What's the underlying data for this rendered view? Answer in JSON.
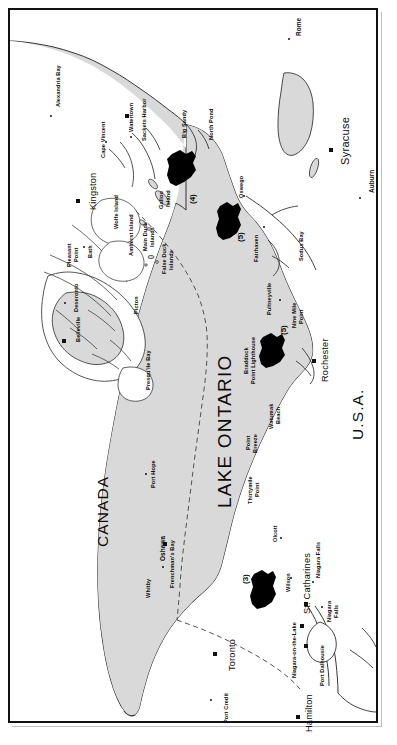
{
  "figure": {
    "title": "Lake Ontario",
    "lake_label": "LAKE ONTARIO",
    "countries": [
      {
        "name": "CANADA"
      },
      {
        "name": "U.S.A."
      }
    ],
    "colors": {
      "water_fill": "#d9d9d9",
      "land_fill": "#ffffff",
      "island_fill": "#d9d9d9",
      "coastline": "#2b2b2b",
      "zone_fill": "#000000",
      "border_dash": "#555555",
      "frame": "#111111",
      "text": "#0d0d0d",
      "hatch": "#9a9a9a"
    }
  },
  "lake": {
    "label": "LAKE ONTARIO"
  },
  "canada_label": "CANADA",
  "usa_label": "U.S.A.",
  "zones": [
    {
      "id": "3",
      "label": "(3)",
      "near": "Wilson / Niagara-on-the-Lake"
    },
    {
      "id": "4",
      "label": "(4)",
      "near": "Galloo Island / Big Sandy"
    },
    {
      "id": "5a",
      "label": "(5)",
      "near": "Oswego"
    },
    {
      "id": "5b",
      "label": "(5)",
      "near": "Braddock Point Lighthouse"
    }
  ],
  "places": {
    "canada_shore": [
      {
        "name": "Alexandria Bay",
        "marker": "dot"
      },
      {
        "name": "Kingston",
        "marker": "square"
      },
      {
        "name": "Pleasant Point",
        "marker": "none"
      },
      {
        "name": "Bath",
        "marker": "dot"
      },
      {
        "name": "Deseronto",
        "marker": "dot"
      },
      {
        "name": "Belleville",
        "marker": "square"
      },
      {
        "name": "Picton",
        "marker": "dot"
      },
      {
        "name": "Presqu'ile Bay",
        "marker": "none"
      },
      {
        "name": "Port Hope",
        "marker": "dot"
      },
      {
        "name": "Oshawa",
        "marker": "square"
      },
      {
        "name": "Whitby",
        "marker": "dot"
      },
      {
        "name": "Frenchman's Bay",
        "marker": "none"
      },
      {
        "name": "Toronto",
        "marker": "square"
      },
      {
        "name": "Port Credit",
        "marker": "dot"
      },
      {
        "name": "Hamilton",
        "marker": "square"
      },
      {
        "name": "St. Catharines",
        "marker": "square"
      },
      {
        "name": "Port Dalhousie",
        "marker": "square"
      },
      {
        "name": "Niagara-on-the-Lake",
        "marker": "square"
      },
      {
        "name": "Niagara Falls",
        "marker": "dot"
      }
    ],
    "usa_shore": [
      {
        "name": "Watertown",
        "marker": "square"
      },
      {
        "name": "Sackets Harbor",
        "marker": "dot"
      },
      {
        "name": "Cape Vincent",
        "marker": "dot"
      },
      {
        "name": "Big Sandy",
        "marker": "none"
      },
      {
        "name": "North Pond",
        "marker": "none"
      },
      {
        "name": "Oswego",
        "marker": "dot"
      },
      {
        "name": "Fairhaven",
        "marker": "dot"
      },
      {
        "name": "Sodus Bay",
        "marker": "none"
      },
      {
        "name": "Pultneyville",
        "marker": "dot"
      },
      {
        "name": "Nine Mile Point",
        "marker": "none"
      },
      {
        "name": "Braddock Point Lighthouse",
        "marker": "none"
      },
      {
        "name": "Rochester",
        "marker": "square"
      },
      {
        "name": "Watumak Beach",
        "marker": "none"
      },
      {
        "name": "Point Breeze",
        "marker": "none"
      },
      {
        "name": "Thirtymile Point",
        "marker": "none"
      },
      {
        "name": "Olcott",
        "marker": "dot"
      },
      {
        "name": "Wilson",
        "marker": "dot"
      },
      {
        "name": "Niagara Falls",
        "marker": "dot"
      },
      {
        "name": "Syracuse",
        "marker": "square"
      },
      {
        "name": "Rome",
        "marker": "dot"
      },
      {
        "name": "Auburn",
        "marker": "dot"
      }
    ],
    "islands": [
      {
        "name": "Wolfe Island"
      },
      {
        "name": "Amherst Island"
      },
      {
        "name": "Main Duck Islands"
      },
      {
        "name": "False Duck Islands"
      },
      {
        "name": "Galloo Island"
      }
    ]
  },
  "labels": [
    {
      "id": "alexandria-bay",
      "text": "Alexandria Bay",
      "x": 46,
      "y": 97,
      "cls": "small rot"
    },
    {
      "id": "kingston",
      "text": "Kingston",
      "x": 79,
      "y": 200,
      "cls": "city rot"
    },
    {
      "id": "pleasant-point-1",
      "text": "Pleasant",
      "x": 57,
      "y": 257,
      "cls": "small rot"
    },
    {
      "id": "pleasant-point-2",
      "text": "Point",
      "x": 64,
      "y": 252,
      "cls": "small rot"
    },
    {
      "id": "bath",
      "text": "Bath",
      "x": 78,
      "y": 248,
      "cls": "small rot"
    },
    {
      "id": "deseronto",
      "text": "Deseronto",
      "x": 64,
      "y": 302,
      "cls": "small rot"
    },
    {
      "id": "belleville",
      "text": "Belleville",
      "x": 66,
      "y": 332,
      "cls": "small rot"
    },
    {
      "id": "picton",
      "text": "Picton",
      "x": 124,
      "y": 304,
      "cls": "small rot"
    },
    {
      "id": "wolfe-island",
      "text": "Wolfe Island",
      "x": 104,
      "y": 219,
      "cls": "small rot"
    },
    {
      "id": "amherst-island",
      "text": "Amherst Island",
      "x": 119,
      "y": 246,
      "cls": "small rot"
    },
    {
      "id": "main-duck-1",
      "text": "Main Duck",
      "x": 133,
      "y": 241,
      "cls": "small rot"
    },
    {
      "id": "main-duck-2",
      "text": "Islands",
      "x": 140,
      "y": 237,
      "cls": "small rot"
    },
    {
      "id": "false-duck-1",
      "text": "False Duck",
      "x": 152,
      "y": 264,
      "cls": "small rot"
    },
    {
      "id": "false-duck-2",
      "text": "Islands",
      "x": 159,
      "y": 260,
      "cls": "small rot"
    },
    {
      "id": "galloo-1",
      "text": "Galloo",
      "x": 149,
      "y": 199,
      "cls": "small rot"
    },
    {
      "id": "galloo-2",
      "text": "Island",
      "x": 156,
      "y": 197,
      "cls": "small rot"
    },
    {
      "id": "cape-vincent",
      "text": "Cape Vincent",
      "x": 91,
      "y": 148,
      "cls": "small rot"
    },
    {
      "id": "watertown",
      "text": "Watertown",
      "x": 119,
      "y": 122,
      "cls": "small rot"
    },
    {
      "id": "sackets-harbor",
      "text": "Sackets Harbor",
      "x": 132,
      "y": 131,
      "cls": "small rot"
    },
    {
      "id": "big-sandy",
      "text": "Big Sandy",
      "x": 172,
      "y": 128,
      "cls": "small rot"
    },
    {
      "id": "north-pond",
      "text": "North Pond",
      "x": 199,
      "y": 130,
      "cls": "small rot"
    },
    {
      "id": "oswego",
      "text": "Oswego",
      "x": 229,
      "y": 188,
      "cls": "small rot"
    },
    {
      "id": "fairhaven",
      "text": "Fairhaven",
      "x": 244,
      "y": 252,
      "cls": "small rot"
    },
    {
      "id": "sodus-bay",
      "text": "Sodus Bay",
      "x": 289,
      "y": 251,
      "cls": "small rot"
    },
    {
      "id": "pultneyville",
      "text": "Pultneyville",
      "x": 257,
      "y": 305,
      "cls": "small rot"
    },
    {
      "id": "nine-mile-1",
      "text": "Nine Mile",
      "x": 282,
      "y": 318,
      "cls": "small rot"
    },
    {
      "id": "nine-mile-2",
      "text": "Point",
      "x": 289,
      "y": 314,
      "cls": "small rot"
    },
    {
      "id": "braddock-1",
      "text": "Braddock",
      "x": 234,
      "y": 364,
      "cls": "small rot"
    },
    {
      "id": "braddock-2",
      "text": "Point Lighthouse",
      "x": 241,
      "y": 374,
      "cls": "small rot"
    },
    {
      "id": "rochester",
      "text": "Rochester",
      "x": 311,
      "y": 372,
      "cls": "city rot"
    },
    {
      "id": "watumak-1",
      "text": "Watumak",
      "x": 259,
      "y": 419,
      "cls": "small rot"
    },
    {
      "id": "watumak-2",
      "text": "Beach",
      "x": 266,
      "y": 414,
      "cls": "small rot"
    },
    {
      "id": "point-breeze-1",
      "text": "Point",
      "x": 236,
      "y": 440,
      "cls": "small rot"
    },
    {
      "id": "point-breeze-2",
      "text": "Breeze",
      "x": 243,
      "y": 443,
      "cls": "small rot"
    },
    {
      "id": "thirtymile-1",
      "text": "Thirtymile",
      "x": 238,
      "y": 494,
      "cls": "small rot"
    },
    {
      "id": "thirtymile-2",
      "text": "Point",
      "x": 245,
      "y": 487,
      "cls": "small rot"
    },
    {
      "id": "olcott",
      "text": "Olcott",
      "x": 263,
      "y": 532,
      "cls": "small rot"
    },
    {
      "id": "wilson",
      "text": "Wilson",
      "x": 276,
      "y": 582,
      "cls": "small rot"
    },
    {
      "id": "st-catharines",
      "text": "St. Catharines",
      "x": 293,
      "y": 604,
      "cls": "city rot"
    },
    {
      "id": "niagara-falls-on",
      "text": "Niagara Falls",
      "x": 306,
      "y": 568,
      "cls": "small rot"
    },
    {
      "id": "niagara-falls-ny-1",
      "text": "Niagara",
      "x": 317,
      "y": 612,
      "cls": "small rot"
    },
    {
      "id": "niagara-falls-ny-2",
      "text": "Falls",
      "x": 324,
      "y": 608,
      "cls": "small rot"
    },
    {
      "id": "port-dalhousie",
      "text": "Port Dalhousie",
      "x": 310,
      "y": 676,
      "cls": "small rot"
    },
    {
      "id": "niagara-on-the-lake",
      "text": "Niagara-on-the-Lake",
      "x": 282,
      "y": 668,
      "cls": "small rot"
    },
    {
      "id": "hamilton",
      "text": "Hamilton",
      "x": 295,
      "y": 722,
      "cls": "city rot"
    },
    {
      "id": "toronto",
      "text": "Toronto",
      "x": 218,
      "y": 661,
      "cls": "city rot"
    },
    {
      "id": "port-credit",
      "text": "Port Credit",
      "x": 214,
      "y": 713,
      "cls": "small rot"
    },
    {
      "id": "oshawa",
      "text": "Oshawa",
      "x": 150,
      "y": 551,
      "cls": "town rot"
    },
    {
      "id": "whitby",
      "text": "Whitby",
      "x": 136,
      "y": 588,
      "cls": "small rot"
    },
    {
      "id": "frenchmans-bay",
      "text": "Frenchman's Bay",
      "x": 160,
      "y": 578,
      "cls": "small rot"
    },
    {
      "id": "port-hope",
      "text": "Port Hope",
      "x": 141,
      "y": 478,
      "cls": "small rot"
    },
    {
      "id": "presquile-bay",
      "text": "Presqu'ile Bay",
      "x": 136,
      "y": 380,
      "cls": "small rot"
    },
    {
      "id": "syracuse",
      "text": "Syracuse",
      "x": 330,
      "y": 155,
      "cls": "bigcity rot"
    },
    {
      "id": "rome",
      "text": "Rome",
      "x": 286,
      "y": 26,
      "cls": "town rot"
    },
    {
      "id": "auburn",
      "text": "Auburn",
      "x": 359,
      "y": 183,
      "cls": "town rot"
    },
    {
      "id": "canada",
      "text": "CANADA",
      "x": 85,
      "y": 537,
      "cls": "country rot"
    },
    {
      "id": "usa",
      "text": "U.S.A.",
      "x": 340,
      "y": 430,
      "cls": "country rot"
    },
    {
      "id": "lake-ontario",
      "text": "LAKE ONTARIO",
      "x": 205,
      "y": 498,
      "cls": "lakename rot"
    },
    {
      "id": "zone-3",
      "text": "(3)",
      "x": 232,
      "y": 574,
      "cls": "zoneno rot"
    },
    {
      "id": "zone-4",
      "text": "(4)",
      "x": 179,
      "y": 194,
      "cls": "zoneno rot"
    },
    {
      "id": "zone-5a",
      "text": "(5)",
      "x": 227,
      "y": 232,
      "cls": "zoneno rot"
    },
    {
      "id": "zone-5b",
      "text": "(5)",
      "x": 270,
      "y": 325,
      "cls": "zoneno rot"
    }
  ],
  "markers": [
    {
      "id": "m-alexandria-bay",
      "type": "dot",
      "x": 41,
      "y": 106
    },
    {
      "id": "m-kingston",
      "type": "square",
      "x": 68,
      "y": 191
    },
    {
      "id": "m-bath",
      "type": "dot",
      "x": 74,
      "y": 237
    },
    {
      "id": "m-deseronto",
      "type": "dot",
      "x": 55,
      "y": 293
    },
    {
      "id": "m-belleville",
      "type": "square",
      "x": 54,
      "y": 331
    },
    {
      "id": "m-cape-vincent",
      "type": "dot",
      "x": 96,
      "y": 132
    },
    {
      "id": "m-watertown",
      "type": "square",
      "x": 117,
      "y": 106
    },
    {
      "id": "m-sackets-harbor",
      "type": "dot",
      "x": 121,
      "y": 127
    },
    {
      "id": "m-oswego",
      "type": "dot",
      "x": 234,
      "y": 186
    },
    {
      "id": "m-fairhaven",
      "type": "dot",
      "x": 254,
      "y": 217
    },
    {
      "id": "m-pultneyville",
      "type": "dot",
      "x": 270,
      "y": 290
    },
    {
      "id": "m-rochester",
      "type": "square",
      "x": 304,
      "y": 351
    },
    {
      "id": "m-olcott",
      "type": "dot",
      "x": 271,
      "y": 528
    },
    {
      "id": "m-wilson",
      "type": "dot",
      "x": 281,
      "y": 568
    },
    {
      "id": "m-st-catharines",
      "type": "square",
      "x": 296,
      "y": 594
    },
    {
      "id": "m-niagara-falls-on",
      "type": "dot",
      "x": 303,
      "y": 572
    },
    {
      "id": "m-niagara-falls-ny",
      "type": "dot",
      "x": 312,
      "y": 597
    },
    {
      "id": "m-port-dalhousie",
      "type": "square",
      "x": 296,
      "y": 636
    },
    {
      "id": "m-niagara-on-the-lake",
      "type": "square",
      "x": 292,
      "y": 616
    },
    {
      "id": "m-hamilton",
      "type": "square",
      "x": 288,
      "y": 707
    },
    {
      "id": "m-toronto",
      "type": "square",
      "x": 205,
      "y": 644
    },
    {
      "id": "m-port-credit",
      "type": "dot",
      "x": 201,
      "y": 690
    },
    {
      "id": "m-oshawa",
      "type": "square",
      "x": 155,
      "y": 534
    },
    {
      "id": "m-whitby",
      "type": "dot",
      "x": 153,
      "y": 557
    },
    {
      "id": "m-port-hope",
      "type": "dot",
      "x": 136,
      "y": 464
    },
    {
      "id": "m-syracuse",
      "type": "square",
      "x": 321,
      "y": 140
    },
    {
      "id": "m-rome",
      "type": "dot",
      "x": 279,
      "y": 29
    },
    {
      "id": "m-auburn",
      "type": "dot",
      "x": 350,
      "y": 188
    }
  ]
}
